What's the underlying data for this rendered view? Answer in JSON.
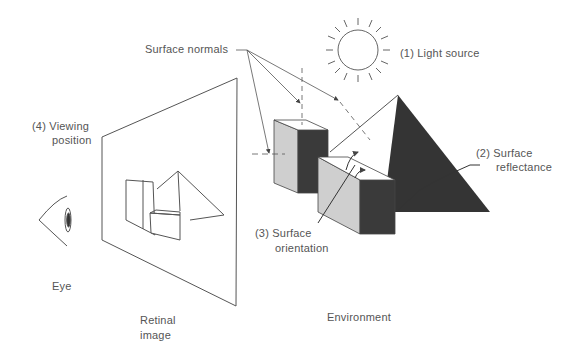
{
  "labels": {
    "surface_normals": "Surface normals",
    "light_source": "(1) Light source",
    "surface_reflectance_1": "(2) Surface",
    "surface_reflectance_2": "reflectance",
    "surface_orientation_1": "(3) Surface",
    "surface_orientation_2": "orientation",
    "viewing_position_1": "(4) Viewing",
    "viewing_position_2": "position",
    "eye": "Eye",
    "retinal_image_1": "Retinal",
    "retinal_image_2": "image",
    "environment": "Environment"
  },
  "colors": {
    "line": "#555555",
    "light_face": "#cfcfcf",
    "dark_face": "#3a3a3a",
    "pyramid_dark": "#333333"
  }
}
